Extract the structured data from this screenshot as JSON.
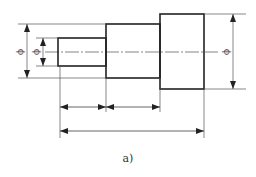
{
  "figure": {
    "caption": "a)",
    "diameter_symbol": "ϕ",
    "steps": [
      {
        "name": "small-step",
        "x1": 58,
        "x2": 106,
        "y1": 38,
        "y2": 66
      },
      {
        "name": "middle-step",
        "x1": 106,
        "x2": 160,
        "y1": 24,
        "y2": 78
      },
      {
        "name": "large-step",
        "x1": 160,
        "x2": 204,
        "y1": 14,
        "y2": 89
      }
    ],
    "dimensions": {
      "diameter_left_outer": "ϕ",
      "diameter_left_inner": "ϕ",
      "diameter_right": "ϕ"
    },
    "colors": {
      "line": "#222222",
      "thin": "#555555",
      "background": "#ffffff"
    }
  }
}
